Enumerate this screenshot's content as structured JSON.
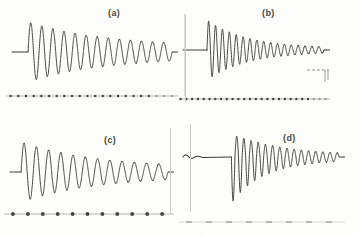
{
  "figure": {
    "title": "",
    "background_color": "#fdfdfb",
    "trace_color": "#3a3a38",
    "marker_color": "#2b2b29",
    "divider_color": "#c9c9c6",
    "width": 358,
    "height": 235
  },
  "panels": [
    {
      "id": "a",
      "label": "(a)",
      "label_x": 108,
      "label_y": 8,
      "description": "damped oscillation ringdown, symmetric decay, dense timing marker line below",
      "baseline_y": 52,
      "marker_line_y": 96,
      "marker_count": 22,
      "marker_style": "small-dots"
    },
    {
      "id": "b",
      "label": "(b)",
      "label_x": 262,
      "label_y": 8,
      "description": "damped oscillation with sharp onset after flat pretrigger, vertical start marker, small secondary trace fragment lower right",
      "baseline_y": 50,
      "marker_line_y": 99,
      "marker_count": 26,
      "marker_style": "small-dots",
      "has_start_marker": true,
      "has_inset_fragment": true
    },
    {
      "id": "c",
      "label": "(c)",
      "label_x": 104,
      "label_y": 135,
      "description": "damped oscillation ringdown, symmetric decay, sparse large timing marker dots below",
      "baseline_y": 172,
      "marker_line_y": 214,
      "marker_count": 11,
      "marker_style": "large-dots"
    },
    {
      "id": "d",
      "label": "(d)",
      "label_x": 283,
      "label_y": 133,
      "description": "pretrigger ripple then flat baseline then asymmetric burst decaying to symmetric oscillation, faint dashed marker line below",
      "baseline_y": 157,
      "marker_line_y": 222,
      "marker_count": 8,
      "marker_style": "faint-dashes"
    }
  ],
  "chart_data": {
    "type": "line",
    "title": "",
    "xlabel": "",
    "ylabel": "",
    "grid": false,
    "legend": "none",
    "series": [
      {
        "name": "(a)",
        "panel": "a",
        "waveform": "damped-sine",
        "pretrigger_flat_fraction": 0.09,
        "onset_x": 0.1,
        "initial_amplitude": 1.0,
        "final_amplitude": 0.17,
        "cycles": 13,
        "decay_constant": 1.85,
        "phase": 0,
        "asymmetry": 0.0,
        "x_range": [
          0,
          1
        ],
        "y_range": [
          -1,
          1
        ]
      },
      {
        "name": "(b)",
        "panel": "b",
        "waveform": "damped-sine",
        "pretrigger_flat_fraction": 0.16,
        "onset_x": 0.17,
        "initial_amplitude": 1.0,
        "final_amplitude": 0.05,
        "cycles": 17,
        "decay_constant": 2.9,
        "phase": 0,
        "asymmetry": 0.0,
        "x_range": [
          0,
          1
        ],
        "y_range": [
          -1,
          1
        ]
      },
      {
        "name": "(c)",
        "panel": "c",
        "waveform": "damped-sine",
        "pretrigger_flat_fraction": 0.06,
        "onset_x": 0.07,
        "initial_amplitude": 1.0,
        "final_amplitude": 0.13,
        "cycles": 12,
        "decay_constant": 1.95,
        "phase": 0,
        "asymmetry": 0.0,
        "x_range": [
          0,
          1
        ],
        "y_range": [
          -1,
          1
        ]
      },
      {
        "name": "(d)",
        "panel": "d",
        "waveform": "damped-sine-asymmetric",
        "pretrigger_flat_fraction": 0.3,
        "onset_x": 0.31,
        "initial_amplitude": 1.0,
        "final_amplitude": 0.07,
        "cycles": 15,
        "decay_constant": 2.6,
        "phase": 3.1416,
        "asymmetry": 0.55,
        "x_range": [
          0,
          1
        ],
        "y_range": [
          -1,
          1
        ]
      }
    ],
    "marker_lines": [
      {
        "panel": "a",
        "count": 22,
        "style": "small-dots"
      },
      {
        "panel": "b",
        "count": 26,
        "style": "small-dots"
      },
      {
        "panel": "c",
        "count": 11,
        "style": "large-dots"
      },
      {
        "panel": "d",
        "count": 8,
        "style": "faint-dashes"
      }
    ]
  }
}
